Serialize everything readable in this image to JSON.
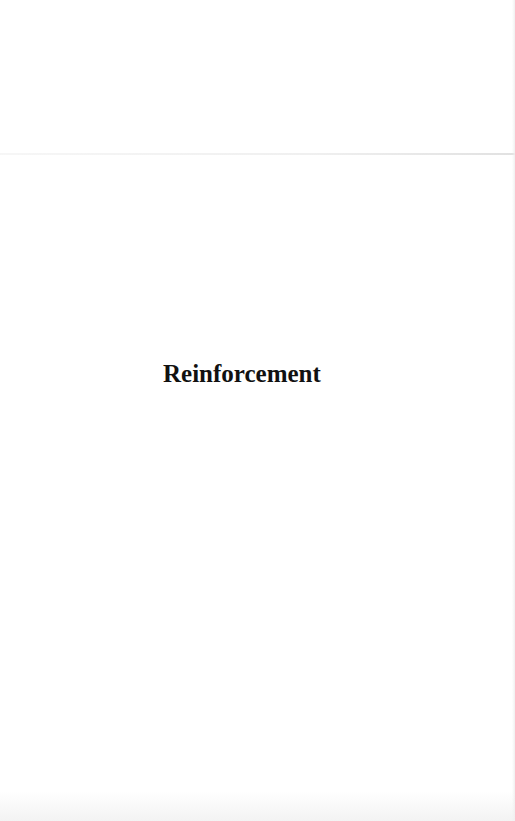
{
  "page": {
    "heading": "Reinforcement"
  }
}
